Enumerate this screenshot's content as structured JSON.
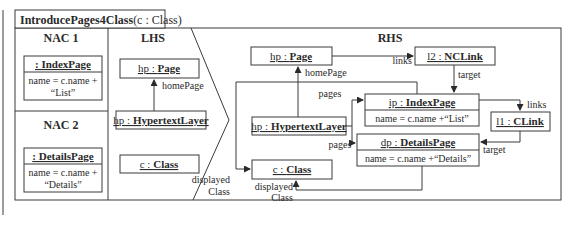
{
  "rule": {
    "name": "IntroducePages4Class",
    "params": "(c : Class)"
  },
  "sections": {
    "nac1": "NAC 1",
    "nac2": "NAC 2",
    "lhs": "LHS",
    "rhs": "RHS"
  },
  "nac1": {
    "object": {
      "name": "",
      "type": "IndexPage",
      "label": ": IndexPage"
    },
    "attr_line1": "name = c.name +",
    "attr_line2": "“List”"
  },
  "nac2": {
    "object": {
      "name": "",
      "type": "DetailsPage",
      "label": ": DetailsPage"
    },
    "attr_line1": "name = c.name +",
    "attr_line2": "“Details”"
  },
  "lhs": {
    "page": {
      "name": "hp : ",
      "type": "Page"
    },
    "hypertext": {
      "name": "hp : ",
      "type": "HypertextLayer"
    },
    "class": {
      "name": "c : ",
      "type": "Class"
    },
    "edge_homepage": "homePage"
  },
  "rhs": {
    "page": {
      "name": "hp : ",
      "type": "Page"
    },
    "hypertext": {
      "name": "hp : ",
      "type": "HypertextLayer"
    },
    "class": {
      "name": "c : ",
      "type": "Class"
    },
    "ncl": {
      "name": "l2 : ",
      "type": "NCLink"
    },
    "indexpage": {
      "name": "ip : ",
      "type": "IndexPage",
      "attr": "name = c.name +“List”"
    },
    "detailspage": {
      "name": "dp : ",
      "type": "DetailsPage",
      "attr": "name = c.name +“Details”"
    },
    "clink": {
      "name": "l1 : ",
      "type": "CLink"
    },
    "edges": {
      "homePage": "homePage",
      "links1": "links",
      "target1": "target",
      "pages1": "pages",
      "pages2": "pages",
      "links2": "links",
      "target2": "target",
      "displayed1_a": "displayed",
      "displayed1_b": "Class",
      "displayed2_a": "displayed",
      "displayed2_b": "Class"
    }
  }
}
